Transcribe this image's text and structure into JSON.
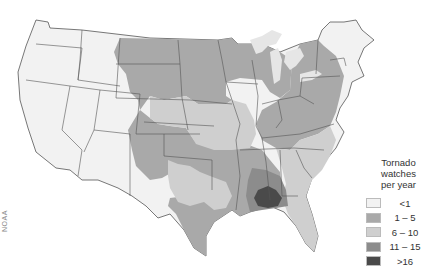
{
  "map": {
    "title": "Tornado watches per year",
    "region": "Contiguous United States",
    "credit": "NOAA"
  },
  "legend": {
    "title_lines": [
      "Tornado",
      "watches",
      "per year"
    ],
    "items": [
      {
        "label": "<1",
        "color": "#f2f2f2"
      },
      {
        "label": "1 – 5",
        "color": "#a9a9a9"
      },
      {
        "label": "6 – 10",
        "color": "#cfcfcf"
      },
      {
        "label": "11 – 15",
        "color": "#8c8c8c"
      },
      {
        "label": ">16",
        "color": "#4a4a4a"
      }
    ]
  },
  "colors": {
    "class_lt1": "#f2f2f2",
    "class_1_5": "#a9a9a9",
    "class_6_10": "#cfcfcf",
    "class_11_15": "#8c8c8c",
    "class_gt16": "#4a4a4a",
    "lakes": "#e6e6e6",
    "borders": "#555555"
  }
}
